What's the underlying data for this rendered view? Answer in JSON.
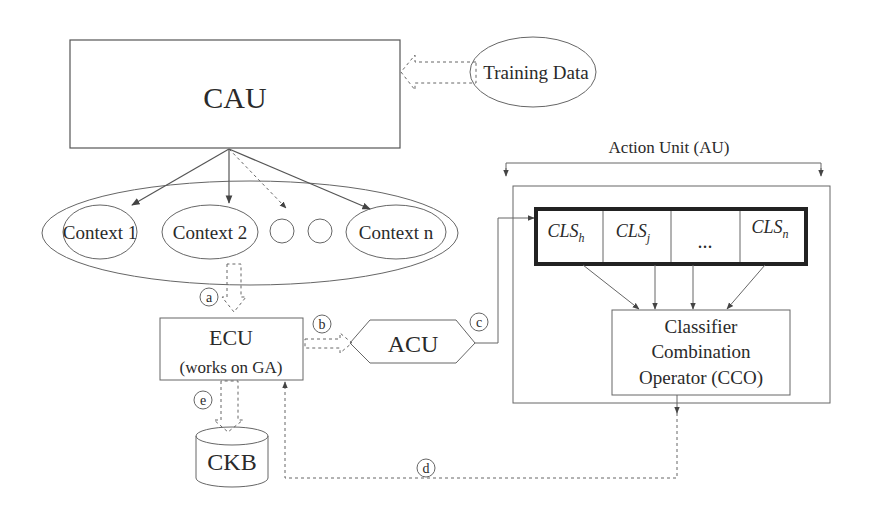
{
  "diagram": {
    "cau": {
      "label": "CAU"
    },
    "training_data": {
      "label": "Training Data"
    },
    "contexts": [
      {
        "label": "Context 1"
      },
      {
        "label": "Context 2"
      },
      {
        "label": "Context n"
      }
    ],
    "ecu": {
      "label": "ECU",
      "sublabel": "(works on GA)"
    },
    "acu": {
      "label": "ACU"
    },
    "ckb": {
      "label": "CKB"
    },
    "action_unit": {
      "label": "Action Unit (AU)",
      "classifiers": [
        {
          "base": "CLS",
          "sub": "h"
        },
        {
          "base": "CLS",
          "sub": "j"
        },
        {
          "base": "...",
          "sub": ""
        },
        {
          "base": "CLS",
          "sub": "n"
        }
      ],
      "cco": {
        "line1": "Classifier",
        "line2": "Combination",
        "line3": "Operator (CCO)"
      }
    },
    "edge_labels": {
      "a": "a",
      "b": "b",
      "c": "c",
      "d": "d",
      "e": "e"
    }
  }
}
